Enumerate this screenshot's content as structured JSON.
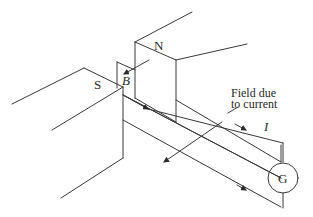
{
  "diagram": {
    "type": "physics-schematic",
    "labels": {
      "north_pole": "N",
      "south_pole": "S",
      "magnetic_field": "B",
      "field_due_to_current_line1": "Field due",
      "field_due_to_current_line2": "to current",
      "current": "I",
      "galvanometer": "G"
    },
    "colors": {
      "line": "#3a3a3a",
      "text": "#2a2a2a",
      "background": "#ffffff"
    }
  }
}
